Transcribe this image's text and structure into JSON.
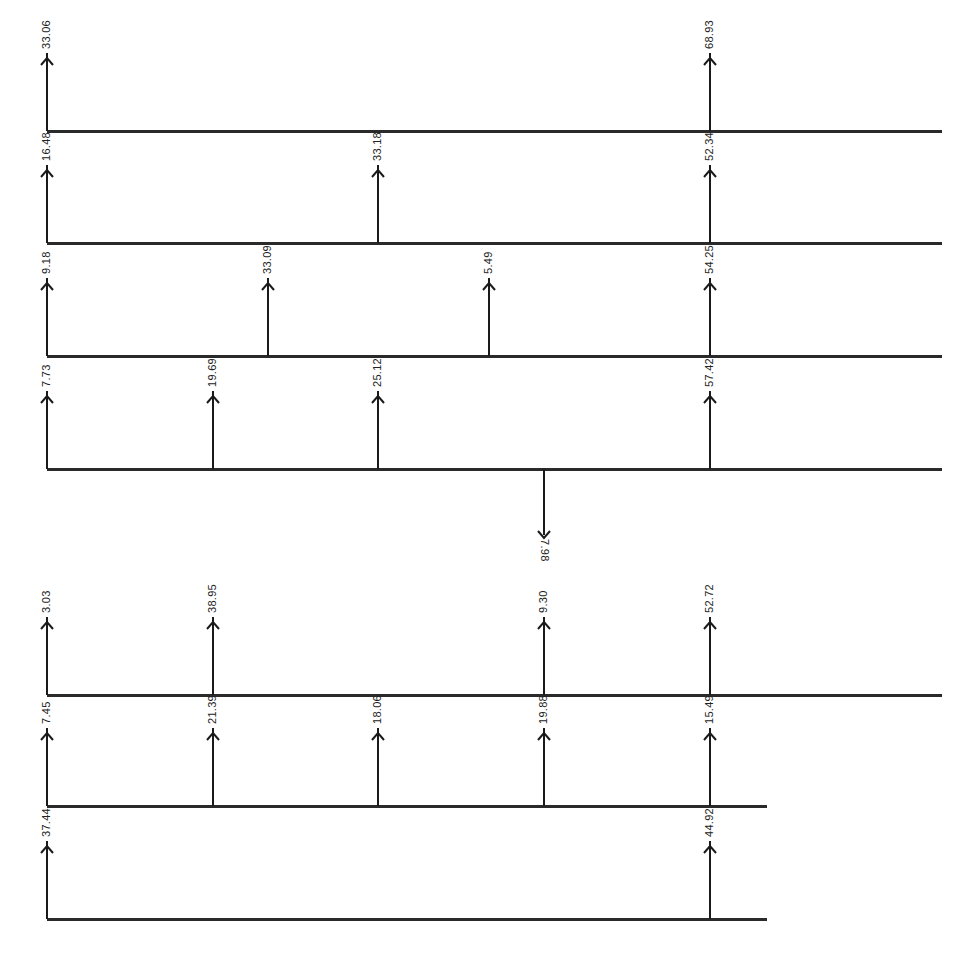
{
  "diagram": {
    "type": "cash-flow-diagrams",
    "rows": [
      {
        "baseline_y": 131,
        "x_end": 942,
        "flows": [
          {
            "x": 47,
            "value": "33.06",
            "direction": "up"
          },
          {
            "x": 710,
            "value": "68.93",
            "direction": "up"
          }
        ]
      },
      {
        "baseline_y": 243,
        "x_end": 942,
        "flows": [
          {
            "x": 47,
            "value": "16.48",
            "direction": "up"
          },
          {
            "x": 378,
            "value": "33.18",
            "direction": "up"
          },
          {
            "x": 710,
            "value": "52.34",
            "direction": "up"
          }
        ]
      },
      {
        "baseline_y": 356,
        "x_end": 942,
        "flows": [
          {
            "x": 47,
            "value": "9.18",
            "direction": "up"
          },
          {
            "x": 268,
            "value": "33.09",
            "direction": "up"
          },
          {
            "x": 489,
            "value": "5.49",
            "direction": "up"
          },
          {
            "x": 710,
            "value": "54.25",
            "direction": "up"
          }
        ]
      },
      {
        "baseline_y": 469,
        "x_end": 942,
        "flows": [
          {
            "x": 47,
            "value": "7.73",
            "direction": "up"
          },
          {
            "x": 213,
            "value": "19.69",
            "direction": "up"
          },
          {
            "x": 378,
            "value": "25.12",
            "direction": "up"
          },
          {
            "x": 544,
            "value": "7.98",
            "direction": "down"
          },
          {
            "x": 710,
            "value": "57.42",
            "direction": "up"
          }
        ]
      },
      {
        "baseline_y": 695,
        "x_end": 942,
        "flows": [
          {
            "x": 47,
            "value": "3.03",
            "direction": "up"
          },
          {
            "x": 213,
            "value": "38.95",
            "direction": "up"
          },
          {
            "x": 544,
            "value": "9.30",
            "direction": "up"
          },
          {
            "x": 710,
            "value": "52.72",
            "direction": "up"
          }
        ]
      },
      {
        "baseline_y": 806,
        "x_end": 767,
        "flows": [
          {
            "x": 47,
            "value": "7.45",
            "direction": "up"
          },
          {
            "x": 213,
            "value": "21.39",
            "direction": "up"
          },
          {
            "x": 378,
            "value": "18.06",
            "direction": "up"
          },
          {
            "x": 544,
            "value": "19.88",
            "direction": "up"
          },
          {
            "x": 710,
            "value": "15.49",
            "direction": "up"
          }
        ]
      },
      {
        "baseline_y": 919,
        "x_end": 767,
        "flows": [
          {
            "x": 47,
            "value": "37.44",
            "direction": "up"
          },
          {
            "x": 710,
            "value": "44.92",
            "direction": "up"
          }
        ]
      }
    ],
    "colors": {
      "line": "#2a2a2a",
      "arrow": "#1a1a1a",
      "text": "#222222",
      "background": "#ffffff"
    }
  }
}
